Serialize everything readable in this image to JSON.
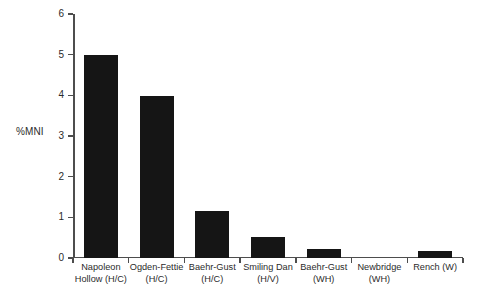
{
  "chart_data": {
    "type": "bar",
    "title": "",
    "xlabel": "",
    "ylabel": "%MNI",
    "ylim": [
      0,
      6
    ],
    "yticks": [
      0,
      1,
      2,
      3,
      4,
      5,
      6
    ],
    "ytick_labels": [
      "0",
      "1",
      "2",
      "3",
      "4",
      "5",
      "6"
    ],
    "grid": false,
    "legend": false,
    "bar_color": "#151515",
    "axis_color": "#4d4d4d",
    "categories": [
      "Napoleon Hollow (H/C)",
      "Ogden-Fettie (H/C)",
      "Baehr-Gust (H/C)",
      "Smiling Dan (H/V)",
      "Baehr-Gust (WH)",
      "Newbridge (WH)",
      "Rench (W)"
    ],
    "category_lines": [
      [
        "Napoleon",
        "Hollow (H/C)"
      ],
      [
        "Ogden-Fettie",
        "(H/C)"
      ],
      [
        "Baehr-Gust",
        "(H/C)"
      ],
      [
        "Smiling Dan",
        "(H/V)"
      ],
      [
        "Baehr-Gust",
        "(WH)"
      ],
      [
        "Newbridge",
        "(WH)"
      ],
      [
        "Rench (W)",
        ""
      ]
    ],
    "values": [
      5.0,
      3.98,
      1.15,
      0.52,
      0.23,
      0.0,
      0.17
    ]
  }
}
